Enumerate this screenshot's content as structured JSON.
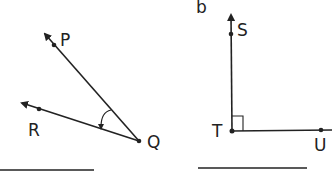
{
  "figure_b_label": "b",
  "angle_a": {
    "vertex": "Q",
    "ray1_point": "P",
    "ray2_point": "R",
    "marking": "curved arc with arrow",
    "points": {
      "P": "P",
      "Q": "Q",
      "R": "R"
    }
  },
  "angle_b": {
    "vertex": "T",
    "ray1_point": "S",
    "ray2_point": "U",
    "marking": "right angle square",
    "points": {
      "S": "S",
      "T": "T",
      "U": "U"
    }
  },
  "colors": {
    "stroke": "#222222",
    "background": "#ffffff"
  }
}
